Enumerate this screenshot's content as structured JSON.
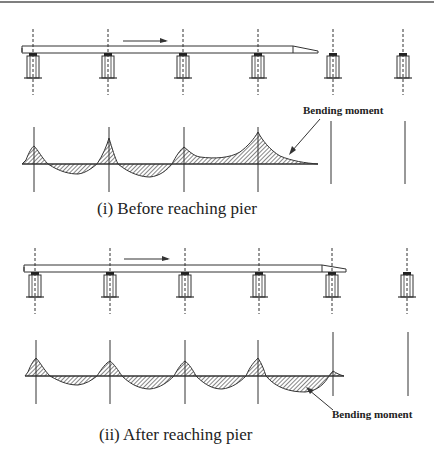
{
  "figure": {
    "colors": {
      "line": "#333333",
      "hatch": "#333333",
      "background": "#ffffff"
    },
    "pier_x": [
      33,
      108,
      183,
      258,
      333,
      403
    ],
    "panels": [
      {
        "id": "before",
        "caption": "(i) Before reaching pier",
        "annotation": "Bending moment",
        "girder_end_x": 318,
        "arrow_label": "launching direction"
      },
      {
        "id": "after",
        "caption": "(ii) After reaching pier",
        "annotation": "Bending moment",
        "girder_end_x": 346,
        "arrow_label": "launching direction"
      }
    ]
  }
}
